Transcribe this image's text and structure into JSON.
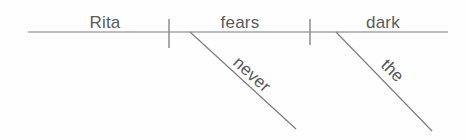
{
  "diagram": {
    "type": "sentence-diagram",
    "style": "reed-kellogg",
    "sentence": "Rita never fears the dark",
    "colors": {
      "background": "#fefefe",
      "line": "#7b7b81",
      "text": "#5a5a5e"
    },
    "baseline": {
      "x1": 28,
      "y1": 32,
      "x2": 448,
      "y2": 32
    },
    "dividers": [
      {
        "name": "subject-verb-divider",
        "x": 169,
        "y1": 19,
        "y2": 48
      },
      {
        "name": "verb-object-divider",
        "x": 310,
        "y1": 19,
        "y2": 45
      }
    ],
    "main_words": [
      {
        "text": "Rita",
        "role": "subject",
        "x": 105,
        "y": 28,
        "anchor": "middle"
      },
      {
        "text": "fears",
        "role": "verb",
        "x": 240,
        "y": 28,
        "anchor": "middle"
      },
      {
        "text": "dark",
        "role": "direct-object",
        "x": 383,
        "y": 28,
        "anchor": "middle"
      }
    ],
    "modifiers": [
      {
        "text": "never",
        "role": "adverb-modifier",
        "modifies": "fears",
        "line": {
          "x1": 190,
          "y1": 32,
          "x2": 296,
          "y2": 129
        },
        "label": {
          "x": 232,
          "y": 64,
          "rotation": 42
        }
      },
      {
        "text": "the",
        "role": "article-modifier",
        "modifies": "dark",
        "line": {
          "x1": 336,
          "y1": 32,
          "x2": 432,
          "y2": 131
        },
        "label": {
          "x": 380,
          "y": 66,
          "rotation": 45
        }
      }
    ]
  }
}
